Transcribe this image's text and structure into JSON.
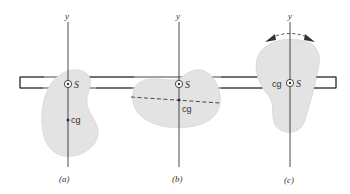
{
  "figure": {
    "colors": {
      "stroke": "#333333",
      "fill": "#e3e3e3",
      "background": "#ffffff"
    },
    "panels": [
      {
        "id": "a",
        "axis_label": "y",
        "shear_center_label": "S",
        "cg_label": "cg",
        "caption": "(a)"
      },
      {
        "id": "b",
        "axis_label": "y",
        "shear_center_label": "S",
        "cg_label": "cg",
        "caption": "(b)"
      },
      {
        "id": "c",
        "axis_label": "y",
        "shear_center_label": "S",
        "cg_label": "cg",
        "caption": "(c)"
      }
    ]
  }
}
